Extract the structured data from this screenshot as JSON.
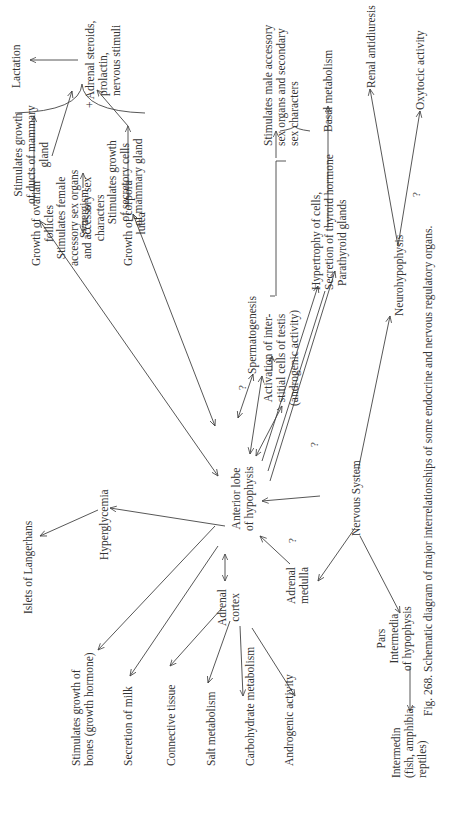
{
  "figure": {
    "caption": "Fig. 268. Schematic diagram of major interrelationships of some endocrine and nervous regulatory organs.",
    "orientation": "rotated 90° counter-clockwise"
  },
  "nodes": {
    "lactation": "Lactation",
    "adrenal_steroids": [
      "+ Adrenal steroids,",
      "prolactin,",
      "nervous stimuli"
    ],
    "ducts_mammary": [
      "Stimulates growth",
      "of ducts of mammary",
      "gland"
    ],
    "secretory_mammary": [
      "Stimulates growth",
      "of secretory cells",
      "of mammary gland"
    ],
    "female_accessory": [
      "Stimulates female",
      "accessory sex organs",
      "and accessory sex",
      "characters"
    ],
    "ovarian_follicles": [
      "Growth of ovarian",
      "follicles"
    ],
    "synergism": "Synergism",
    "corpora_lutea": [
      "Growth of corpora",
      "lutea"
    ],
    "male_accessory": [
      "Stimulates male accessory",
      "sex organs and secondary",
      "sex characters"
    ],
    "spermatogenesis": "Spermatogenesis",
    "interstitial_cells": [
      "Activation of inter-",
      "stitial cells of testis",
      "(androgenic activity)"
    ],
    "basal_metabolism": "Basal metabolism",
    "thyroid": [
      "Hypertrophy of cells,",
      "Secretion of thyroid hormone"
    ],
    "parathyroid": "Parathyroid glands",
    "renal_antidiuresis": "Renal antidiuresis",
    "oxytocic": "Oxytocic activity",
    "neurohypophysis": "Neurohypophysis",
    "anterior_lobe": [
      "Anterior lobe",
      "of hypophysis"
    ],
    "nervous_system": "Nervous System",
    "islets": "Islets of Langerhans",
    "hyperglycemia": "Hyperglycemia",
    "growth_bones": [
      "Stimulates growth of",
      "bones (growth hormone)"
    ],
    "secretion_milk": "Secretion of milk",
    "adrenal_cortex": [
      "Adrenal",
      "cortex"
    ],
    "adrenal_medulla": [
      "Adrenal",
      "medulla"
    ],
    "connective_tissue": "Connective tissue",
    "salt_metabolism": "Salt metabolism",
    "carbohydrate_metabolism": "Carbohydrate metabolism",
    "androgenic_activity": "Androgenic activity",
    "pars_intermedia": [
      "Pars",
      "Intermedia",
      "of hypophysis"
    ],
    "intermedin": [
      "Intermedin",
      "(fish, amphibia,",
      "reptiles)"
    ]
  },
  "marks": {
    "question": "?"
  },
  "colors": {
    "ink": "#3a3a3a",
    "paper": "#ffffff"
  }
}
